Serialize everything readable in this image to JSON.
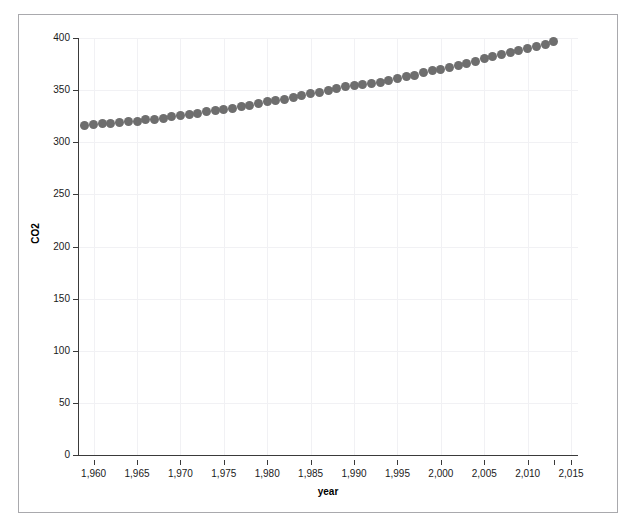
{
  "chart_data": {
    "type": "scatter",
    "title": "",
    "xlabel": "year",
    "ylabel": "CO2",
    "xlim": [
      1958.2,
      2015.8
    ],
    "ylim": [
      0,
      400
    ],
    "grid": true,
    "legend": "none",
    "marker": {
      "shape": "circle",
      "color": "#6e6e6e",
      "size_px": 9
    },
    "xticks": [
      1960,
      1965,
      1970,
      1975,
      1980,
      1985,
      1990,
      1995,
      2000,
      2005,
      2010,
      2015
    ],
    "xtick_labels": [
      "1,960",
      "1,965",
      "1,970",
      "1,975",
      "1,980",
      "1,985",
      "1,990",
      "1,995",
      "2,000",
      "2,005",
      "2,010",
      "2,015"
    ],
    "yticks": [
      0,
      50,
      100,
      150,
      200,
      250,
      300,
      350,
      400
    ],
    "ytick_labels": [
      "0",
      "50",
      "100",
      "150",
      "200",
      "250",
      "300",
      "350",
      "400"
    ],
    "x": [
      1959,
      1960,
      1961,
      1962,
      1963,
      1964,
      1965,
      1966,
      1967,
      1968,
      1969,
      1970,
      1971,
      1972,
      1973,
      1974,
      1975,
      1976,
      1977,
      1978,
      1979,
      1980,
      1981,
      1982,
      1983,
      1984,
      1985,
      1986,
      1987,
      1988,
      1989,
      1990,
      1991,
      1992,
      1993,
      1994,
      1995,
      1996,
      1997,
      1998,
      1999,
      2000,
      2001,
      2002,
      2003,
      2004,
      2005,
      2006,
      2007,
      2008,
      2009,
      2010,
      2011,
      2012,
      2013
    ],
    "y": [
      315.98,
      316.91,
      317.64,
      318.45,
      318.99,
      319.62,
      320.04,
      321.37,
      322.18,
      323.05,
      324.62,
      325.68,
      326.32,
      327.46,
      329.68,
      330.19,
      331.12,
      332.03,
      333.84,
      335.41,
      336.84,
      338.76,
      340.12,
      341.48,
      343.15,
      344.85,
      346.35,
      347.61,
      349.31,
      351.69,
      353.2,
      354.45,
      355.7,
      356.54,
      357.21,
      358.96,
      360.97,
      362.74,
      363.88,
      366.84,
      368.54,
      369.71,
      371.32,
      373.45,
      375.98,
      377.7,
      379.98,
      382.09,
      384.02,
      385.83,
      387.64,
      390.1,
      391.85,
      394.06,
      396.52
    ],
    "series_name": "CO2"
  }
}
